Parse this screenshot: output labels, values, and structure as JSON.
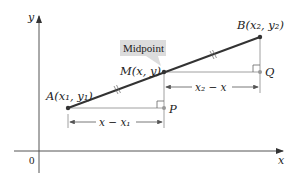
{
  "diagram": {
    "callout": "Midpoint",
    "axes": {
      "x_label": "x",
      "y_label": "y",
      "origin_label": "0"
    },
    "points": {
      "A": {
        "label": "A(x₁, y₁)"
      },
      "M": {
        "label": "M(x, y)"
      },
      "B": {
        "label": "B(x₂, y₂)"
      },
      "P": {
        "label": "P"
      },
      "Q": {
        "label": "Q"
      }
    },
    "dimensions": {
      "lower": "x − x₁",
      "upper": "x₂ − x"
    },
    "colors": {
      "segment": "#333333",
      "axes": "#555555",
      "guides": "#888888",
      "callout_bg": "#dcdcdc"
    }
  }
}
